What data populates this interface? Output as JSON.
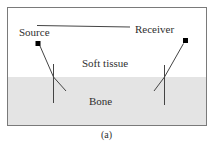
{
  "figure": {
    "caption": "(a)",
    "labels": {
      "source": "Source",
      "receiver": "Receiver",
      "soft_tissue": "Soft tissue",
      "bone": "Bone"
    },
    "colors": {
      "background": "#ffffff",
      "frame_border": "#7a7a7a",
      "bone_fill": "#e4e4e4",
      "line": "#444444",
      "marker": "#000000",
      "text": "#2f2f2f"
    }
  }
}
